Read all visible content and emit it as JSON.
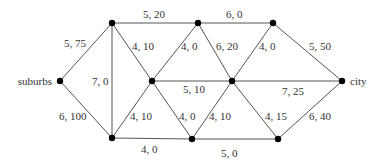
{
  "diagram": {
    "type": "flow-network",
    "nodes": [
      {
        "id": "suburbs",
        "label": "suburbs",
        "x": 60,
        "y": 81
      },
      {
        "id": "a",
        "label": "",
        "x": 112,
        "y": 23
      },
      {
        "id": "b",
        "label": "",
        "x": 198,
        "y": 23
      },
      {
        "id": "c",
        "label": "",
        "x": 273,
        "y": 23
      },
      {
        "id": "d",
        "label": "",
        "x": 152,
        "y": 81
      },
      {
        "id": "e",
        "label": "",
        "x": 232,
        "y": 81
      },
      {
        "id": "city",
        "label": "city",
        "x": 342,
        "y": 81
      },
      {
        "id": "f",
        "label": "",
        "x": 112,
        "y": 138
      },
      {
        "id": "g",
        "label": "",
        "x": 192,
        "y": 139
      },
      {
        "id": "h",
        "label": "",
        "x": 278,
        "y": 139
      }
    ],
    "edges": [
      {
        "from": "suburbs",
        "to": "a",
        "label": "5, 75",
        "lx": 64,
        "ly": 47
      },
      {
        "from": "suburbs",
        "to": "f",
        "label": "6, 100",
        "lx": 59,
        "ly": 120
      },
      {
        "from": "a",
        "to": "f",
        "label": "7, 0",
        "lx": 92,
        "ly": 85
      },
      {
        "from": "a",
        "to": "b",
        "label": "5, 20",
        "lx": 143,
        "ly": 18
      },
      {
        "from": "a",
        "to": "d",
        "label": "4, 10",
        "lx": 132,
        "ly": 50
      },
      {
        "from": "b",
        "to": "c",
        "label": "6, 0",
        "lx": 226,
        "ly": 18
      },
      {
        "from": "b",
        "to": "d",
        "label": "4, 0",
        "lx": 181,
        "ly": 50
      },
      {
        "from": "b",
        "to": "e",
        "label": "6, 20",
        "lx": 216,
        "ly": 50
      },
      {
        "from": "c",
        "to": "e",
        "label": "4, 0",
        "lx": 259,
        "ly": 50
      },
      {
        "from": "c",
        "to": "city",
        "label": "5, 50",
        "lx": 309,
        "ly": 50
      },
      {
        "from": "d",
        "to": "e",
        "label": "5, 10",
        "lx": 183,
        "ly": 93
      },
      {
        "from": "e",
        "to": "city",
        "label": "7, 25",
        "lx": 282,
        "ly": 95
      },
      {
        "from": "d",
        "to": "f",
        "label": "4, 10",
        "lx": 130,
        "ly": 120
      },
      {
        "from": "d",
        "to": "g",
        "label": "4, 0",
        "lx": 179,
        "ly": 120
      },
      {
        "from": "e",
        "to": "g",
        "label": "4, 10",
        "lx": 209,
        "ly": 120
      },
      {
        "from": "e",
        "to": "h",
        "label": "4, 15",
        "lx": 265,
        "ly": 120
      },
      {
        "from": "h",
        "to": "city",
        "label": "6, 40",
        "lx": 309,
        "ly": 120
      },
      {
        "from": "f",
        "to": "g",
        "label": "4, 0",
        "lx": 141,
        "ly": 153
      },
      {
        "from": "g",
        "to": "h",
        "label": "5, 0",
        "lx": 221,
        "ly": 157
      }
    ]
  }
}
